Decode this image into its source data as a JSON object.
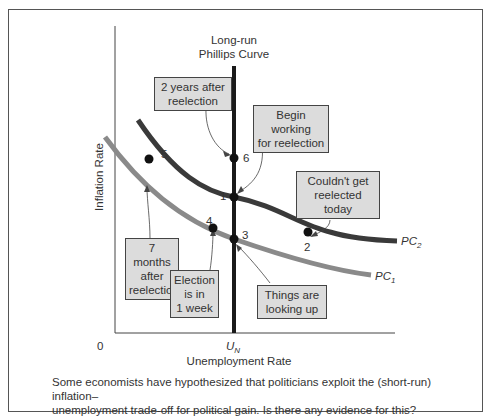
{
  "figure": {
    "lrpc_label_line1": "Long-run",
    "lrpc_label_line2": "Phillips Curve",
    "y_axis_label": "Inflation Rate",
    "x_axis_label": "Unemployment Rate",
    "origin_label": "0",
    "un_label_main": "U",
    "un_label_sub": "N",
    "curves": [
      {
        "name": "PC",
        "sub": "2",
        "color": "#3a3a3a"
      },
      {
        "name": "PC",
        "sub": "1",
        "color": "#8a8a8a"
      }
    ],
    "points": [
      {
        "id": "1",
        "label": "1"
      },
      {
        "id": "2",
        "label": "2"
      },
      {
        "id": "3",
        "label": "3"
      },
      {
        "id": "4",
        "label": "4"
      },
      {
        "id": "5",
        "label": "5"
      },
      {
        "id": "6",
        "label": "6"
      }
    ],
    "callouts": {
      "two_years": [
        "2 years after",
        "reelection"
      ],
      "begin_working": [
        "Begin working",
        "for reelection"
      ],
      "couldnt_get": [
        "Couldn't get",
        "reelected today"
      ],
      "seven_months": [
        "7 months",
        "after",
        "reelection"
      ],
      "election_week": [
        "Election",
        "is in",
        "1 week"
      ],
      "things_up": [
        "Things are",
        "looking up"
      ]
    },
    "colors": {
      "callout_fill": "#dcdcdc",
      "pc1": "#8a8a8a",
      "pc2": "#3a3a3a",
      "lrpc": "#1a1a1a"
    }
  },
  "caption": {
    "line1": "Some economists have hypothesized that politicians exploit the (short-run) inflation–",
    "line2": "unemployment trade-off for political gain. Is there any evidence for this?"
  }
}
